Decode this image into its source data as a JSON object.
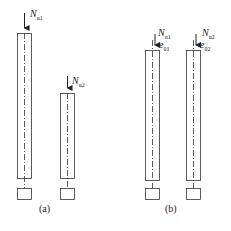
{
  "figure": {
    "panel_a": {
      "caption": "(a)",
      "loads": [
        {
          "symbol": "N",
          "subscript": "u1"
        },
        {
          "symbol": "N",
          "subscript": "u2"
        }
      ]
    },
    "panel_b": {
      "caption": "(b)",
      "loads": [
        {
          "symbol": "N",
          "subscript": "u1",
          "eccentricity_symbol": "e",
          "eccentricity_subscript": "01"
        },
        {
          "symbol": "N",
          "subscript": "u2",
          "eccentricity_symbol": "e",
          "eccentricity_subscript": "02"
        }
      ]
    }
  }
}
